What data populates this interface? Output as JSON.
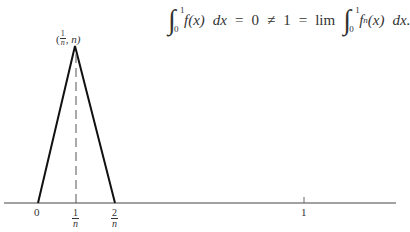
{
  "equation": {
    "lhs_integral": {
      "lower": "0",
      "upper": "1",
      "integrand": "f(x)",
      "dx": "dx"
    },
    "eq1": "=",
    "lhs_value": "0",
    "neq": "≠",
    "rhs_value": "1",
    "eq2": "=",
    "lim": "lim",
    "rhs_integral": {
      "lower": "0",
      "upper": "1",
      "integrand": "f",
      "subscript": "n",
      "arg": "(x)",
      "dx": "dx."
    }
  },
  "figure": {
    "peak_label": {
      "open": "(",
      "num": "1",
      "den": "n",
      "rest": ", n)"
    },
    "axis_labels": [
      {
        "id": "zero",
        "text": "0"
      },
      {
        "id": "one-over-n",
        "num": "1",
        "den": "n"
      },
      {
        "id": "two-over-n",
        "num": "2",
        "den": "n"
      },
      {
        "id": "one",
        "text": "1"
      }
    ],
    "function": {
      "description": "triangle f_n",
      "points": [
        [
          0,
          0
        ],
        [
          "1/n",
          "n"
        ],
        [
          "2/n",
          0
        ]
      ]
    }
  }
}
